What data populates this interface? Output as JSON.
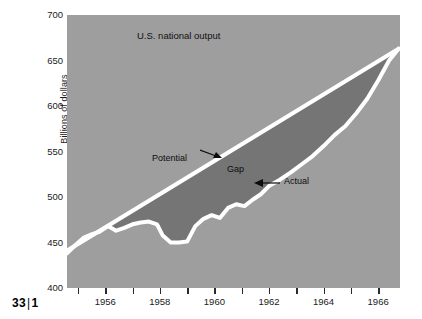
{
  "figure": {
    "caption_number": "33",
    "caption_separator": "|",
    "caption_index": "1"
  },
  "colors": {
    "plot_background": "#9e9e9e",
    "gap_fill": "#757575",
    "line": "#ffffff",
    "text": "#1a1a1a",
    "page_background": "#ffffff"
  },
  "annotations": [
    {
      "name": "potential",
      "label": "Potential",
      "arrow": "right"
    },
    {
      "name": "gap",
      "label": "Gap",
      "arrow": "none"
    },
    {
      "name": "actual",
      "label": "Actual",
      "arrow": "left"
    }
  ],
  "chart_data": {
    "type": "area",
    "title": "U.S. national output",
    "xlabel": "",
    "ylabel": "Billions of dollars",
    "xlim": [
      1954.6,
      1966.8
    ],
    "ylim": [
      400,
      700
    ],
    "ytick_labels": [
      "400",
      "450",
      "500",
      "550",
      "600",
      "650",
      "700"
    ],
    "yticks": [
      400,
      450,
      500,
      550,
      600,
      650,
      700
    ],
    "xtick_labels": [
      "1956",
      "1958",
      "1960",
      "1962",
      "1964",
      "1966"
    ],
    "xticks": [
      1956,
      1958,
      1960,
      1962,
      1964,
      1966
    ],
    "xticks_minor": [
      1955,
      1957,
      1959,
      1961,
      1963,
      1965
    ],
    "grid": false,
    "legend": "none",
    "series": [
      {
        "name": "Potential",
        "x": [
          1954.6,
          1966.75
        ],
        "values": [
          441,
          663
        ]
      },
      {
        "name": "Actual",
        "x": [
          1954.6,
          1954.9,
          1955.2,
          1955.5,
          1955.8,
          1956.1,
          1956.4,
          1956.7,
          1957.0,
          1957.3,
          1957.6,
          1957.9,
          1958.1,
          1958.4,
          1958.7,
          1959.0,
          1959.3,
          1959.6,
          1959.9,
          1960.2,
          1960.5,
          1960.8,
          1961.1,
          1961.4,
          1961.7,
          1962.0,
          1962.4,
          1962.8,
          1963.2,
          1963.6,
          1964.0,
          1964.4,
          1964.8,
          1965.2,
          1965.6,
          1966.0,
          1966.4,
          1966.75
        ],
        "values": [
          438,
          447,
          455,
          459,
          462,
          468,
          463,
          466,
          470,
          472,
          473,
          470,
          458,
          450,
          450,
          451,
          468,
          476,
          480,
          477,
          488,
          492,
          490,
          497,
          503,
          512,
          519,
          527,
          536,
          545,
          556,
          568,
          578,
          592,
          608,
          628,
          650,
          663
        ]
      }
    ],
    "shaded_region": {
      "name": "Gap",
      "between": [
        "Potential",
        "Actual"
      ],
      "description": "Difference between potential and actual national output"
    }
  }
}
